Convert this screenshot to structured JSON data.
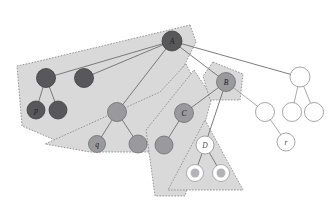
{
  "figure": {
    "title": "",
    "width": 335,
    "height": 204,
    "background": "#ffffff"
  },
  "palette": {
    "region_fill": "#d9d9d9",
    "region_stroke": "#8c8c8c",
    "edge": "#6e6e6e",
    "edge_light": "#a0a0a0",
    "node_dark": "#58585a",
    "node_mid": "#9a9a9c",
    "node_white": "#ffffff",
    "node_ring_inner": "#b3b3b5"
  },
  "regions": [
    {
      "name": "region-a",
      "points": "190,25 196,42 186,62 166,95 62,143 22,126 17,66 35,62"
    },
    {
      "name": "region-q",
      "points": "186,64 200,92 171,152 90,152 45,144 160,92"
    },
    {
      "name": "region-c",
      "points": "194,70 212,97 185,196 155,196 146,130"
    },
    {
      "name": "region-b",
      "points": "213,62 243,74 240,100 210,100 203,76"
    },
    {
      "name": "region-d",
      "points": "205,120 243,190 168,190"
    }
  ],
  "edges": [
    {
      "name": "edge-a-to-dark-left",
      "from": [
        172,
        41
      ],
      "to": [
        46,
        78
      ],
      "style": "dark"
    },
    {
      "name": "edge-a-to-dark-mid",
      "from": [
        172,
        41
      ],
      "to": [
        84,
        78
      ],
      "style": "dark"
    },
    {
      "name": "edge-a-to-b",
      "from": [
        172,
        41
      ],
      "to": [
        226,
        82
      ],
      "style": "dark"
    },
    {
      "name": "edge-a-to-white-top",
      "from": [
        172,
        41
      ],
      "to": [
        300,
        77
      ],
      "style": "dark"
    },
    {
      "name": "edge-a-to-mid-parent",
      "from": [
        172,
        41
      ],
      "to": [
        117,
        112
      ],
      "style": "dark"
    },
    {
      "name": "edge-dark-left-to-p",
      "from": [
        46,
        78
      ],
      "to": [
        36,
        110
      ],
      "style": "dark"
    },
    {
      "name": "edge-dark-left-to-s",
      "from": [
        46,
        78
      ],
      "to": [
        58,
        110
      ],
      "style": "dark"
    },
    {
      "name": "edge-midparent-to-q",
      "from": [
        117,
        112
      ],
      "to": [
        97,
        144
      ],
      "style": "dark"
    },
    {
      "name": "edge-midparent-to-s",
      "from": [
        117,
        112
      ],
      "to": [
        138,
        144
      ],
      "style": "dark"
    },
    {
      "name": "edge-b-to-c",
      "from": [
        226,
        82
      ],
      "to": [
        184,
        113
      ],
      "style": "dark"
    },
    {
      "name": "edge-b-to-d",
      "from": [
        226,
        82
      ],
      "to": [
        205,
        145
      ],
      "style": "dark"
    },
    {
      "name": "edge-b-to-white-left",
      "from": [
        226,
        82
      ],
      "to": [
        265,
        112
      ],
      "style": "light"
    },
    {
      "name": "edge-c-to-leaf",
      "from": [
        184,
        113
      ],
      "to": [
        164,
        145
      ],
      "style": "dark"
    },
    {
      "name": "edge-d-to-leaf-left",
      "from": [
        205,
        145
      ],
      "to": [
        195,
        173
      ],
      "style": "dark"
    },
    {
      "name": "edge-d-to-leaf-right",
      "from": [
        205,
        145
      ],
      "to": [
        221,
        173
      ],
      "style": "dark"
    },
    {
      "name": "edge-white-top-to-m",
      "from": [
        300,
        77
      ],
      "to": [
        292,
        112
      ],
      "style": "light"
    },
    {
      "name": "edge-white-top-to-r2",
      "from": [
        300,
        77
      ],
      "to": [
        314,
        112
      ],
      "style": "light"
    },
    {
      "name": "edge-white-left-to-r",
      "from": [
        265,
        112
      ],
      "to": [
        286,
        142
      ],
      "style": "light"
    }
  ],
  "nodes": [
    {
      "name": "node-a",
      "label": "A",
      "x": 172,
      "y": 41,
      "r": 10,
      "fill": "dark",
      "label_class": "label-on-dark"
    },
    {
      "name": "node-dark-left",
      "label": "",
      "x": 46,
      "y": 78,
      "r": 9.5,
      "fill": "dark",
      "label_class": ""
    },
    {
      "name": "node-dark-mid",
      "label": "",
      "x": 84,
      "y": 78,
      "r": 9.5,
      "fill": "dark",
      "label_class": ""
    },
    {
      "name": "node-p",
      "label": "p",
      "x": 36,
      "y": 110,
      "r": 9,
      "fill": "dark",
      "label_class": "label-on-dark"
    },
    {
      "name": "node-dark-sibling",
      "label": "",
      "x": 58,
      "y": 110,
      "r": 9,
      "fill": "dark",
      "label_class": ""
    },
    {
      "name": "node-mid-parent",
      "label": "",
      "x": 117,
      "y": 112,
      "r": 9.5,
      "fill": "mid",
      "label_class": ""
    },
    {
      "name": "node-q",
      "label": "q",
      "x": 97,
      "y": 144,
      "r": 8.5,
      "fill": "mid",
      "label_class": "label-on-mid"
    },
    {
      "name": "node-mid-sibling",
      "label": "",
      "x": 138,
      "y": 144,
      "r": 9,
      "fill": "mid",
      "label_class": ""
    },
    {
      "name": "node-b",
      "label": "B",
      "x": 226,
      "y": 82,
      "r": 9.5,
      "fill": "mid",
      "label_class": "label-on-mid"
    },
    {
      "name": "node-c",
      "label": "C",
      "x": 184,
      "y": 113,
      "r": 9.5,
      "fill": "mid",
      "label_class": "label-on-mid"
    },
    {
      "name": "node-c-leaf",
      "label": "",
      "x": 164,
      "y": 145,
      "r": 9,
      "fill": "mid",
      "label_class": ""
    },
    {
      "name": "node-white-top",
      "label": "",
      "x": 300,
      "y": 77,
      "r": 10,
      "fill": "white",
      "label_class": ""
    },
    {
      "name": "node-white-left",
      "label": "",
      "x": 265,
      "y": 112,
      "r": 9.5,
      "fill": "white",
      "label_class": ""
    },
    {
      "name": "node-white-mid",
      "label": "",
      "x": 292,
      "y": 112,
      "r": 9.5,
      "fill": "white",
      "label_class": ""
    },
    {
      "name": "node-white-right",
      "label": "",
      "x": 314,
      "y": 112,
      "r": 9.5,
      "fill": "white",
      "label_class": ""
    },
    {
      "name": "node-r",
      "label": "r",
      "x": 286,
      "y": 142,
      "r": 9,
      "fill": "white",
      "label_class": "label-on-white"
    },
    {
      "name": "node-d",
      "label": "D",
      "x": 205,
      "y": 145,
      "r": 9,
      "fill": "white",
      "label_class": "label-on-white"
    },
    {
      "name": "node-d-leaf-left",
      "label": "",
      "x": 195,
      "y": 173,
      "r": 8.5,
      "fill": "ring",
      "label_class": ""
    },
    {
      "name": "node-d-leaf-right",
      "label": "",
      "x": 221,
      "y": 173,
      "r": 8.5,
      "fill": "ring",
      "label_class": ""
    }
  ]
}
